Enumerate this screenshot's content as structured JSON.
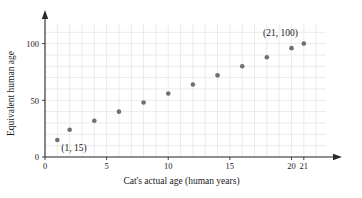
{
  "chart_data": {
    "type": "scatter",
    "title": "",
    "xlabel": "Cat's actual age (human years)",
    "ylabel": "Equivalent human age",
    "xlim": [
      0,
      22.8
    ],
    "ylim": [
      0,
      112
    ],
    "grid": true,
    "legend": "none",
    "x_ticks": [
      0,
      5,
      10,
      15,
      20,
      21
    ],
    "x_tick_labels": [
      "0",
      "5",
      "10",
      "15",
      "20",
      "21"
    ],
    "y_ticks": [
      0,
      50,
      100
    ],
    "y_tick_labels": [
      "0",
      "50",
      "100"
    ],
    "x_minor_step": 1,
    "y_minor_step": 10,
    "series": [
      {
        "name": "cat age vs human age",
        "color": "#6f7073",
        "marker": "circle",
        "points": [
          {
            "x": 1,
            "y": 15
          },
          {
            "x": 2,
            "y": 24
          },
          {
            "x": 4,
            "y": 32
          },
          {
            "x": 6,
            "y": 40
          },
          {
            "x": 8,
            "y": 48
          },
          {
            "x": 10,
            "y": 56
          },
          {
            "x": 12,
            "y": 64
          },
          {
            "x": 14,
            "y": 72
          },
          {
            "x": 16,
            "y": 80
          },
          {
            "x": 18,
            "y": 88
          },
          {
            "x": 20,
            "y": 96
          },
          {
            "x": 21,
            "y": 100
          }
        ]
      }
    ],
    "annotations": [
      {
        "name": "first-point-label",
        "text": "(1, 15)",
        "x": 1,
        "y": 15
      },
      {
        "name": "last-point-label",
        "text": "(21, 100)",
        "x": 21,
        "y": 100
      }
    ],
    "colors": {
      "point": "#6f7073",
      "grid": "#ebebeb",
      "axis": "#2b2b2b",
      "text": "#1a1a1a",
      "background": "#ffffff"
    }
  }
}
